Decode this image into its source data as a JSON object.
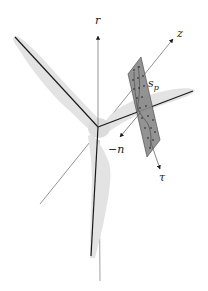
{
  "diagram": {
    "labels": {
      "r": "r",
      "z": "z",
      "s_p": "s",
      "s_p_sub": "p",
      "neg_n": "−n",
      "tau": "τ"
    },
    "components": {
      "blades": [
        "upper-left blade",
        "right blade",
        "lower blade"
      ],
      "axes": [
        "r",
        "z",
        "−n",
        "τ"
      ],
      "plane": "section plane s_p with sample points"
    },
    "colors": {
      "blade_fill": "#e3e3e3",
      "blade_axis": "#1a1a1a",
      "axis_line": "#555555",
      "plane_fill": "#8a8a8a",
      "plane_points": "#222222"
    }
  }
}
